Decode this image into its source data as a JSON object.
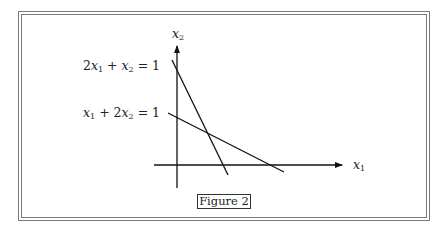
{
  "figure": {
    "caption": "Figure 2",
    "axes": {
      "x_label": "x",
      "x_sub": "1",
      "y_label": "x",
      "y_sub": "2"
    },
    "equations": [
      {
        "text": "2x₁ + x₂ = 1",
        "coef_a": "2",
        "var_a": "x",
        "sub_a": "1",
        "op": " + ",
        "var_b": "x",
        "sub_b": "2",
        "rhs": " = 1"
      },
      {
        "text": "x₁ + 2x₂ = 1",
        "coef_a": "",
        "var_a": "x",
        "sub_a": "1",
        "op": " + 2",
        "var_b": "x",
        "sub_b": "2",
        "rhs": " = 1"
      }
    ]
  }
}
